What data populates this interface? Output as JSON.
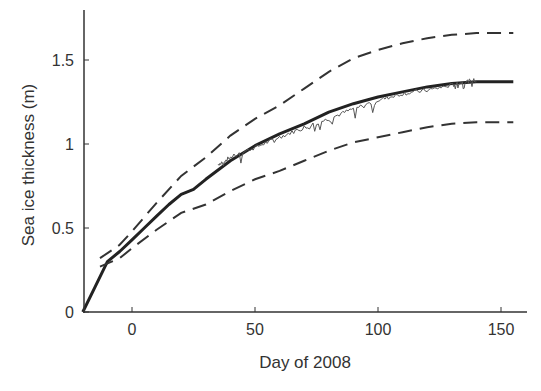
{
  "chart_data": {
    "type": "line",
    "title": "",
    "xlabel": "Day of 2008",
    "ylabel": "Sea ice thickness (m)",
    "xlim": [
      -20,
      160
    ],
    "ylim": [
      0,
      1.8
    ],
    "xticks": [
      0,
      50,
      100,
      150
    ],
    "xtick_labels": [
      "0",
      "50",
      "100",
      "150"
    ],
    "yticks": [
      0,
      0.5,
      1,
      1.5
    ],
    "ytick_labels": [
      "0",
      "0.5",
      "1",
      "1.5"
    ],
    "grid": false,
    "legend": null,
    "colors": {
      "axis": "#333333",
      "line": "#222222",
      "noisy": "#555555"
    },
    "series": [
      {
        "name": "Modeled thickness (mean)",
        "style": "solid-thick",
        "x": [
          -20,
          -15,
          -10,
          -5,
          0,
          5,
          10,
          15,
          20,
          25,
          30,
          40,
          50,
          60,
          70,
          80,
          90,
          100,
          110,
          120,
          130,
          140,
          150,
          155
        ],
        "y": [
          0.0,
          0.15,
          0.3,
          0.36,
          0.43,
          0.5,
          0.57,
          0.64,
          0.7,
          0.73,
          0.79,
          0.9,
          0.99,
          1.06,
          1.12,
          1.19,
          1.24,
          1.28,
          1.31,
          1.34,
          1.36,
          1.37,
          1.37,
          1.37
        ]
      },
      {
        "name": "Observed thickness (noisy)",
        "style": "thin-noisy",
        "x": [
          35,
          40,
          50,
          60,
          70,
          80,
          90,
          100,
          110,
          120,
          130,
          135,
          140
        ],
        "y": [
          0.88,
          0.92,
          0.98,
          1.04,
          1.1,
          1.15,
          1.21,
          1.26,
          1.3,
          1.32,
          1.35,
          1.37,
          1.38
        ]
      },
      {
        "name": "Upper bound",
        "style": "dashed",
        "x": [
          -13,
          -5,
          0,
          10,
          20,
          30,
          40,
          50,
          60,
          70,
          80,
          90,
          100,
          110,
          120,
          130,
          140,
          150,
          155
        ],
        "y": [
          0.32,
          0.4,
          0.48,
          0.65,
          0.81,
          0.92,
          1.05,
          1.15,
          1.23,
          1.33,
          1.43,
          1.51,
          1.56,
          1.6,
          1.63,
          1.65,
          1.66,
          1.66,
          1.66
        ]
      },
      {
        "name": "Lower bound",
        "style": "dashed",
        "x": [
          -13,
          -5,
          0,
          10,
          20,
          30,
          40,
          50,
          60,
          70,
          80,
          90,
          100,
          110,
          120,
          130,
          140,
          150,
          155
        ],
        "y": [
          0.27,
          0.32,
          0.38,
          0.49,
          0.59,
          0.64,
          0.72,
          0.79,
          0.84,
          0.9,
          0.96,
          1.01,
          1.04,
          1.07,
          1.1,
          1.12,
          1.13,
          1.13,
          1.13
        ]
      }
    ]
  }
}
